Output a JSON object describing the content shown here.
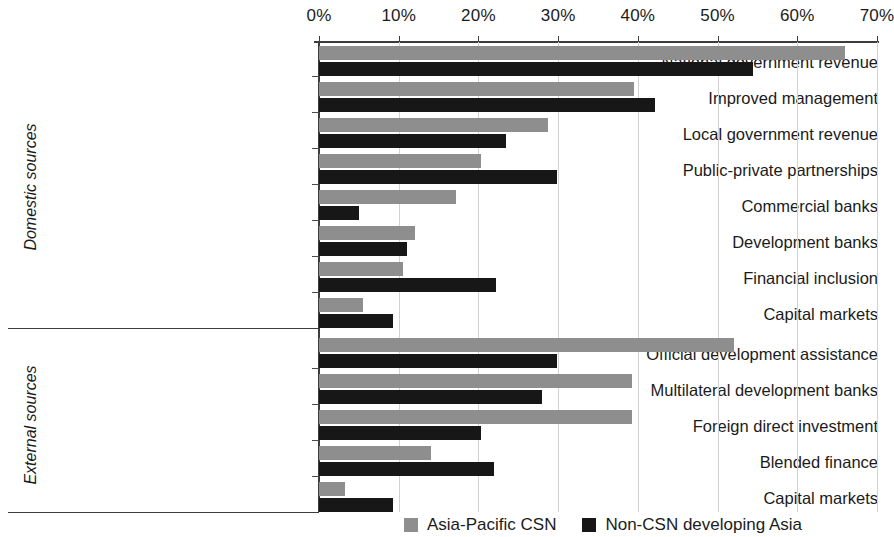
{
  "chart_data": {
    "type": "bar",
    "title": "",
    "orientation": "horizontal",
    "xlabel": "",
    "ylabel": "",
    "xlim": [
      0,
      70
    ],
    "xticks": [
      "0%",
      "10%",
      "20%",
      "30%",
      "40%",
      "50%",
      "60%",
      "70%"
    ],
    "xtick_values": [
      0,
      10,
      20,
      30,
      40,
      50,
      60,
      70
    ],
    "grid": true,
    "legend_position": "bottom-right",
    "colors": {
      "Asia-Pacific CSN": "#8e8e8e",
      "Non-CSN developing Asia": "#171717"
    },
    "groups": [
      {
        "label": "Domestic sources",
        "categories": [
          "National government revenue",
          "Improved management",
          "Local government revenue",
          "Public-private partnerships",
          "Commercial banks",
          "Development banks",
          "Financial inclusion",
          "Capital markets"
        ]
      },
      {
        "label": "External sources",
        "categories": [
          "Official development assistance",
          "Multilateral development banks",
          "Foreign direct investment",
          "Blended finance",
          "Capital markets"
        ]
      }
    ],
    "categories": [
      "National government revenue",
      "Improved management",
      "Local government revenue",
      "Public-private partnerships",
      "Commercial banks",
      "Development banks",
      "Financial inclusion",
      "Capital markets",
      "Official development assistance",
      "Multilateral development banks",
      "Foreign direct investment",
      "Blended finance",
      "Capital markets"
    ],
    "series": [
      {
        "name": "Asia-Pacific CSN",
        "color": "#8e8e8e",
        "values": [
          66.0,
          39.5,
          28.7,
          20.3,
          17.2,
          12.1,
          10.6,
          5.5,
          52.0,
          39.3,
          39.3,
          14.0,
          3.3
        ]
      },
      {
        "name": "Non-CSN developing Asia",
        "color": "#171717",
        "values": [
          54.5,
          42.1,
          23.4,
          29.8,
          5.0,
          11.0,
          22.2,
          9.3,
          29.8,
          28.0,
          20.3,
          22.0,
          9.3
        ]
      }
    ]
  },
  "legend": {
    "items": [
      {
        "label": "Asia-Pacific CSN",
        "swatch": "csn"
      },
      {
        "label": "Non-CSN developing Asia",
        "swatch": "noncsn"
      }
    ]
  }
}
